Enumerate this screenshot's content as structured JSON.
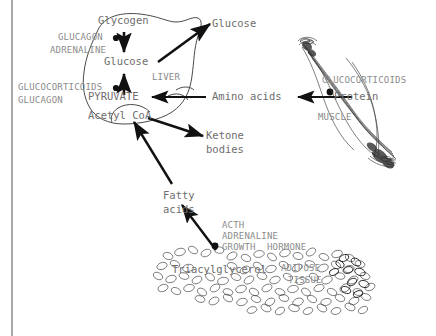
{
  "diagram": {
    "type": "metabolic-pathway",
    "left_rule_color": "#a8a8a8",
    "text_color": "#7a7a7a",
    "line_color": "#1a1a1a"
  },
  "liver": {
    "organ_label": "LIVER",
    "metabolites": {
      "glycogen": "Glycogen",
      "glucose": "Glucose",
      "pyruvate": "PYRUVATE",
      "acetyl_coa": "Acetyl CoA"
    },
    "hormones_glycogenolysis": [
      "GLUCAGON",
      "ADRENALINE"
    ],
    "hormones_gluconeogenesis": [
      "GLUCOCORTICOIDS",
      "GLUCAGON"
    ]
  },
  "muscle": {
    "organ_label": "MUSCLE",
    "metabolite": "Protein",
    "hormones": [
      "GLUCOCORTICOIDS"
    ]
  },
  "adipose": {
    "organ_label_line1": "ADIPOSE",
    "organ_label_line2": "TISSUE",
    "metabolite": "Triacylglycerol",
    "hormones": [
      "ACTH",
      "ADRENALINE",
      "GROWTH  HORMONE"
    ]
  },
  "circulating": {
    "glucose": "Glucose",
    "amino_acids": "Amino acids",
    "ketone_bodies_line1": "Ketone",
    "ketone_bodies_line2": "bodies",
    "fatty_acids_line1": "Fatty",
    "fatty_acids_line2": "acids"
  }
}
